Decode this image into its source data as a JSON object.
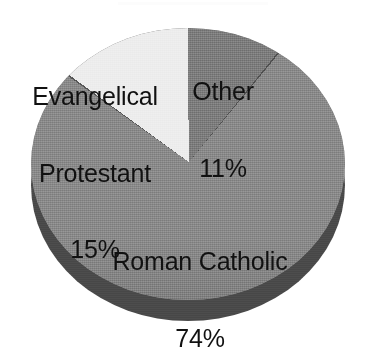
{
  "chart_data": {
    "type": "pie",
    "title": "",
    "subtitle": "",
    "xlabel": "",
    "ylabel": "",
    "legend_position": "none",
    "grid": false,
    "style": "3d-pie",
    "value_unit": "%",
    "categories": [
      "Roman Catholic",
      "Evangelical Protestant",
      "Other"
    ],
    "values": [
      74,
      15,
      11
    ],
    "labels": [
      "Roman Catholic 74%",
      "Evangelical Protestant 15%",
      "Other 11%"
    ],
    "slices": [
      {
        "name": "Roman Catholic",
        "label_lines": [
          "Roman Catholic"
        ],
        "value": 74,
        "value_text": "74%",
        "color": "#8a8a8a",
        "label_placement": "inside"
      },
      {
        "name": "Evangelical Protestant",
        "label_lines": [
          "Evangelical",
          "Protestant"
        ],
        "value": 15,
        "value_text": "15%",
        "color": "#ededed",
        "label_placement": "inside"
      },
      {
        "name": "Other",
        "label_lines": [
          "Other"
        ],
        "value": 11,
        "value_text": "11%",
        "color": "#7d7d7d",
        "label_placement": "inside"
      }
    ],
    "colors": {
      "roman_catholic": "#8a8a8a",
      "evangelical_protestant": "#ededed",
      "other": "#7d7d7d",
      "pie_side_wall": "#4a4a4a",
      "label_text": "#111111",
      "background": "#ffffff"
    }
  },
  "labels": {
    "evangelical": {
      "line1": "Evangelical",
      "line2": "Protestant",
      "percent": "15%"
    },
    "other": {
      "line1": "Other",
      "percent": "11%"
    },
    "catholic": {
      "line1": "Roman Catholic",
      "percent": "74%"
    }
  }
}
